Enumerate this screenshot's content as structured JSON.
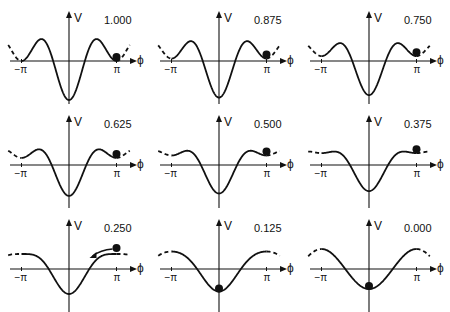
{
  "axes": {
    "y_label": "V",
    "x_label": "ϕ",
    "tick_left": "−π",
    "tick_right": "π"
  },
  "colors": {
    "ink": "#111111",
    "background": "#ffffff"
  },
  "panels": [
    {
      "value": "1.000",
      "s": 1.0,
      "ball": "pi",
      "arrow": false
    },
    {
      "value": "0.875",
      "s": 0.875,
      "ball": "pi",
      "arrow": false
    },
    {
      "value": "0.750",
      "s": 0.75,
      "ball": "pi",
      "arrow": false
    },
    {
      "value": "0.625",
      "s": 0.625,
      "ball": "pi",
      "arrow": false
    },
    {
      "value": "0.500",
      "s": 0.5,
      "ball": "pi",
      "arrow": false
    },
    {
      "value": "0.375",
      "s": 0.375,
      "ball": "pi",
      "arrow": false
    },
    {
      "value": "0.250",
      "s": 0.25,
      "ball": "pi-rolling",
      "arrow": true
    },
    {
      "value": "0.125",
      "s": 0.125,
      "ball": "zero",
      "arrow": false
    },
    {
      "value": "0.000",
      "s": 0.0,
      "ball": "zero",
      "arrow": false
    }
  ],
  "chart_data": {
    "type": "line",
    "xlabel": "ϕ",
    "ylabel": "V",
    "x_ticks": [
      "−π",
      "π"
    ],
    "model": "V(ϕ) = −cos ϕ − s·cos 2ϕ (qualitative)",
    "series": [
      {
        "name": "1.000",
        "ball_position": "ϕ = π (local minimum)"
      },
      {
        "name": "0.875",
        "ball_position": "ϕ = π (local minimum)"
      },
      {
        "name": "0.750",
        "ball_position": "ϕ = π (local minimum)"
      },
      {
        "name": "0.625",
        "ball_position": "ϕ = π (local minimum)"
      },
      {
        "name": "0.500",
        "ball_position": "ϕ = π (local minimum)"
      },
      {
        "name": "0.375",
        "ball_position": "ϕ = π (shallow minimum)"
      },
      {
        "name": "0.250",
        "ball_position": "near ϕ = π, rolling toward ϕ = 0 (arrow)"
      },
      {
        "name": "0.125",
        "ball_position": "ϕ = 0 (global minimum)"
      },
      {
        "name": "0.000",
        "ball_position": "ϕ = 0 (global minimum)"
      }
    ],
    "grid": false,
    "layout": "3x3 small multiples"
  }
}
